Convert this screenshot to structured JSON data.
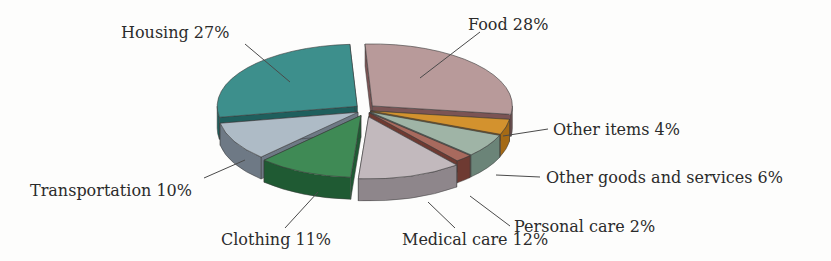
{
  "chart_data": {
    "type": "pie",
    "style": "3d-exploded",
    "title": "",
    "categories": [
      "Food",
      "Other items",
      "Other goods and services",
      "Personal care",
      "Medical care",
      "Clothing",
      "Transportation",
      "Housing"
    ],
    "values": [
      28,
      4,
      6,
      2,
      12,
      11,
      10,
      27
    ],
    "unit": "%",
    "labels": [
      "Food 28%",
      "Other items 4%",
      "Other goods and services 6%",
      "Personal care 2%",
      "Medical care 12%",
      "Clothing 11%",
      "Transportation 10%",
      "Housing 27%"
    ],
    "colors": [
      "#b89a9a",
      "#d3922e",
      "#9fb4a6",
      "#a86a5e",
      "#c2b9bd",
      "#3f8a55",
      "#aebbc6",
      "#3d8f8c"
    ],
    "side_colors": [
      "#7b5454",
      "#a56a15",
      "#6b8478",
      "#6e3a32",
      "#8e868b",
      "#1f5a33",
      "#6e7985",
      "#1f5f5d"
    ],
    "legend": "none (direct labels with leader lines)"
  }
}
